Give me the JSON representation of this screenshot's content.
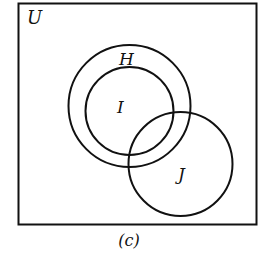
{
  "diagram": {
    "type": "venn",
    "universe": {
      "label": "U"
    },
    "sets": [
      {
        "id": "H",
        "label": "H",
        "cx": 129.5,
        "cy": 106,
        "r": 61
      },
      {
        "id": "I",
        "label": "I",
        "cx": 129.5,
        "cy": 111,
        "r": 44
      },
      {
        "id": "J",
        "label": "J",
        "cx": 180.5,
        "cy": 164,
        "r": 52
      }
    ],
    "relations": [
      "I is a subset of H",
      "J overlaps H",
      "J overlaps I"
    ],
    "caption": "(c)",
    "stroke_color": "#111111",
    "background": "#ffffff"
  }
}
